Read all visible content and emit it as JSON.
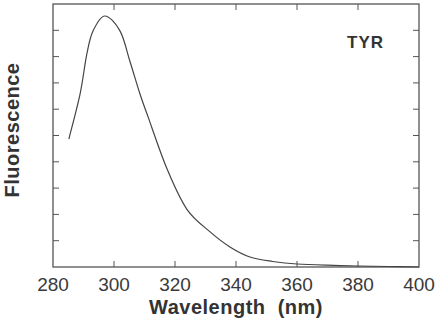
{
  "chart_data": {
    "type": "line",
    "title": "",
    "xlabel": "Wavelength  (nm)",
    "ylabel": "Fluorescence",
    "xlim": [
      280,
      400
    ],
    "ylim": [
      0,
      1.05
    ],
    "x_ticks": [
      280,
      300,
      320,
      340,
      360,
      380,
      400
    ],
    "y_ticks_count": 10,
    "y_tick_labels_shown": false,
    "grid": false,
    "legend": null,
    "annotations": [
      {
        "text": "TYR",
        "x": 378,
        "y": 0.88
      }
    ],
    "series": [
      {
        "name": "TYR",
        "x": [
          285.2,
          288.9,
          291.1,
          293.1,
          297.0,
          302.0,
          305.2,
          308.5,
          311.1,
          317.4,
          323.9,
          331.5,
          338.0,
          344.6,
          352.0,
          360.0,
          370.0,
          380.0,
          390.0,
          400.0
        ],
        "values": [
          0.51,
          0.69,
          0.85,
          0.94,
          1.0,
          0.94,
          0.82,
          0.69,
          0.6,
          0.39,
          0.23,
          0.14,
          0.08,
          0.04,
          0.022,
          0.012,
          0.007,
          0.004,
          0.002,
          0.0
        ]
      }
    ]
  },
  "labels": {
    "xlabel": "Wavelength  (nm)",
    "ylabel": "Fluorescence",
    "annotation": "TYR",
    "x_tick_labels": [
      "280",
      "300",
      "320",
      "340",
      "360",
      "380",
      "400"
    ]
  },
  "colors": {
    "line": "#444444",
    "axis": "#555555",
    "text": "#333333"
  }
}
